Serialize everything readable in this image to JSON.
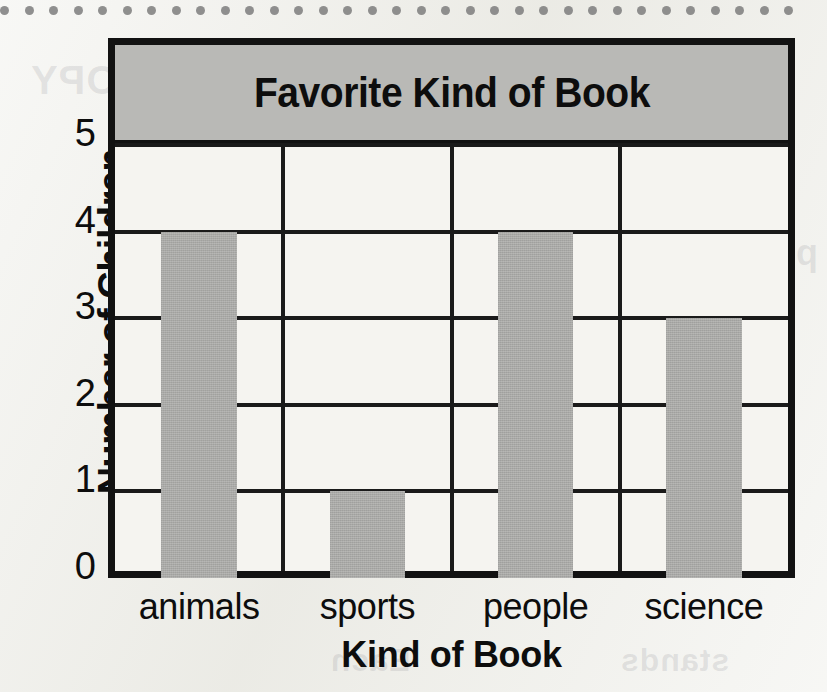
{
  "chart_data": {
    "type": "bar",
    "title": "Favorite Kind of Book",
    "xlabel": "Kind of Book",
    "ylabel": "Number of Children",
    "categories": [
      "animals",
      "sports",
      "people",
      "science"
    ],
    "values": [
      4,
      1,
      4,
      3
    ],
    "ylim": [
      0,
      5
    ],
    "yticks": [
      "0",
      "1",
      "2",
      "3",
      "4",
      "5"
    ],
    "ytick_values": [
      0,
      1,
      2,
      3,
      4,
      5
    ],
    "grid": true,
    "legend": false,
    "legend_position": "none",
    "colors": {
      "bar_fill": "#a9a9a6",
      "title_banner": "#b9b9b6",
      "frame": "#121212",
      "plot_background": "#f5f4f0",
      "page_background": "#efefea",
      "text": "#0d0d0d"
    }
  },
  "page": {
    "binding_hole_count": 33
  },
  "ghost_text": {
    "a": "COPY",
    "b": "10.2",
    "c": "picture graph",
    "d": "violin",
    "e": "chocolate",
    "f": "Draw",
    "g": "Each",
    "h": "stands"
  }
}
